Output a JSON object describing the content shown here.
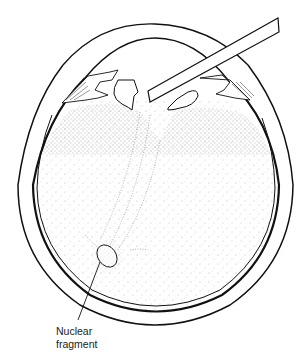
{
  "figure": {
    "colors": {
      "ink": "#111111",
      "stipple": "#555555",
      "background": "#ffffff"
    }
  },
  "labels": {
    "nuclear_fragment_line1": "Nuclear",
    "nuclear_fragment_line2": "fragment"
  }
}
